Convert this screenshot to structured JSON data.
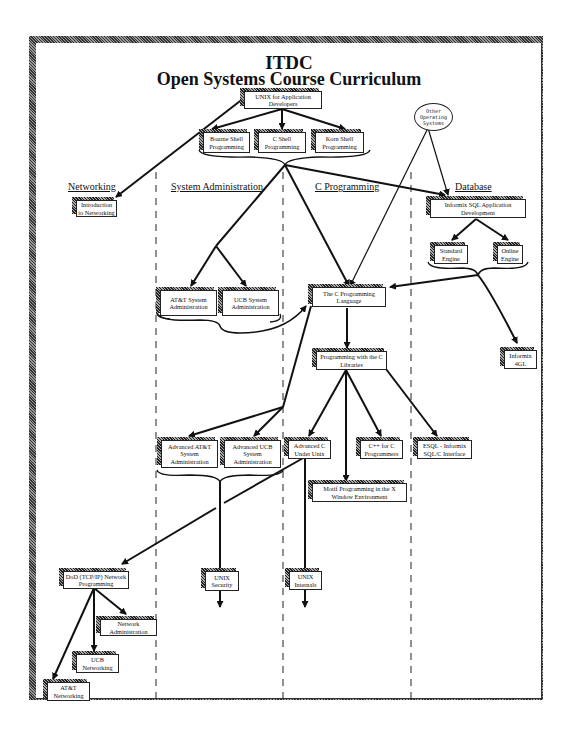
{
  "header": {
    "title": "ITDC",
    "subtitle": "Open Systems Course Curriculum"
  },
  "lanes": [
    {
      "label": "Networking"
    },
    {
      "label": "System Administration"
    },
    {
      "label": "C Programming"
    },
    {
      "label": "Database"
    }
  ],
  "other_os": {
    "label": "Other Operating Systems"
  },
  "courses": [
    {
      "id": "unix_app_dev",
      "label": "UNIX for Application Developers"
    },
    {
      "id": "bourne",
      "label": "Bourne Shell Programming"
    },
    {
      "id": "cshell",
      "label": "C Shell Programming"
    },
    {
      "id": "korn",
      "label": "Korn Shell Programming"
    },
    {
      "id": "intro_net",
      "label": "Introduction to Networking"
    },
    {
      "id": "informix_sql",
      "label": "Informix SQL Application Development"
    },
    {
      "id": "standard_engine",
      "label": "Standard Engine"
    },
    {
      "id": "online_engine",
      "label": "Online Engine"
    },
    {
      "id": "att_sysadmin",
      "label": "AT&T System Administration"
    },
    {
      "id": "ucb_sysadmin",
      "label": "UCB System Administration"
    },
    {
      "id": "c_lang",
      "label": "The C Programming Language"
    },
    {
      "id": "informix_4gl",
      "label": "Informix 4GL"
    },
    {
      "id": "c_libs",
      "label": "Programming with the C Libraries"
    },
    {
      "id": "adv_att",
      "label": "Advanced AT&T System Administration"
    },
    {
      "id": "adv_ucb",
      "label": "Advanced UCB System Administration"
    },
    {
      "id": "adv_c",
      "label": "Advanced C Under Unix"
    },
    {
      "id": "cpp",
      "label": "C++ for C Programmers"
    },
    {
      "id": "esql",
      "label": "ESQL - Informix SQL/C Interface"
    },
    {
      "id": "motif",
      "label": "Motif Programming in the X Window Environment"
    },
    {
      "id": "dod_net",
      "label": "DoD (TCP/IP) Network Programming"
    },
    {
      "id": "unix_security",
      "label": "UNIX Security"
    },
    {
      "id": "unix_internals",
      "label": "UNIX Internals"
    },
    {
      "id": "net_admin",
      "label": "Network Administration"
    },
    {
      "id": "ucb_net",
      "label": "UCB Networking"
    },
    {
      "id": "att_net",
      "label": "AT&T Networking"
    }
  ],
  "edges": [
    [
      "unix_app_dev",
      "bourne"
    ],
    [
      "unix_app_dev",
      "cshell"
    ],
    [
      "unix_app_dev",
      "korn"
    ],
    [
      "unix_app_dev",
      "intro_net"
    ],
    [
      "shells_group",
      "att_sysadmin"
    ],
    [
      "shells_group",
      "ucb_sysadmin"
    ],
    [
      "shells_group",
      "c_lang"
    ],
    [
      "shells_group",
      "informix_sql"
    ],
    [
      "other_os",
      "c_lang"
    ],
    [
      "other_os",
      "informix_sql"
    ],
    [
      "informix_sql",
      "standard_engine"
    ],
    [
      "informix_sql",
      "online_engine"
    ],
    [
      "engines_group",
      "c_lang"
    ],
    [
      "engines_group",
      "informix_4gl"
    ],
    [
      "sysadmin_group",
      "c_lang"
    ],
    [
      "c_lang",
      "c_libs"
    ],
    [
      "c_lang",
      "adv_att"
    ],
    [
      "c_lang",
      "adv_ucb"
    ],
    [
      "c_libs",
      "adv_c"
    ],
    [
      "c_libs",
      "motif"
    ],
    [
      "c_libs",
      "cpp"
    ],
    [
      "c_libs",
      "esql"
    ],
    [
      "adv_sysadmin_group",
      "unix_security"
    ],
    [
      "adv_c",
      "dod_net"
    ],
    [
      "adv_c",
      "unix_internals"
    ],
    [
      "dod_net",
      "net_admin"
    ],
    [
      "dod_net",
      "ucb_net"
    ],
    [
      "dod_net",
      "att_net"
    ]
  ]
}
